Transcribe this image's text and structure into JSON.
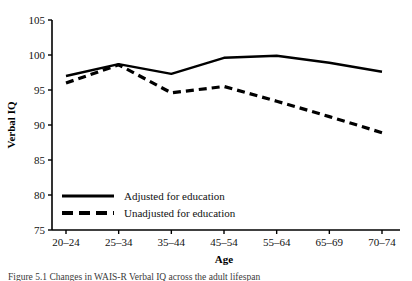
{
  "chart_data": {
    "type": "line",
    "title": "",
    "xlabel": "Age",
    "ylabel": "Verbal IQ",
    "categories": [
      "20–24",
      "25–34",
      "35–44",
      "45–54",
      "55–64",
      "65–69",
      "70–74"
    ],
    "ylim": [
      75,
      105
    ],
    "yticks": [
      75,
      80,
      85,
      90,
      95,
      100,
      105
    ],
    "grid": false,
    "legend_position": "inside-lower-left",
    "series": [
      {
        "name": "Adjusted for education",
        "style": "solid",
        "color": "#000000",
        "values": [
          97.0,
          98.7,
          97.3,
          99.6,
          99.9,
          98.9,
          97.6
        ]
      },
      {
        "name": "Unadjusted for education",
        "style": "dashed",
        "color": "#000000",
        "values": [
          96.0,
          98.6,
          94.6,
          95.5,
          93.4,
          91.2,
          88.9
        ]
      }
    ]
  },
  "caption": {
    "text": "Figure 5.1  Changes in WAIS-R Verbal IQ across the adult lifespan"
  }
}
